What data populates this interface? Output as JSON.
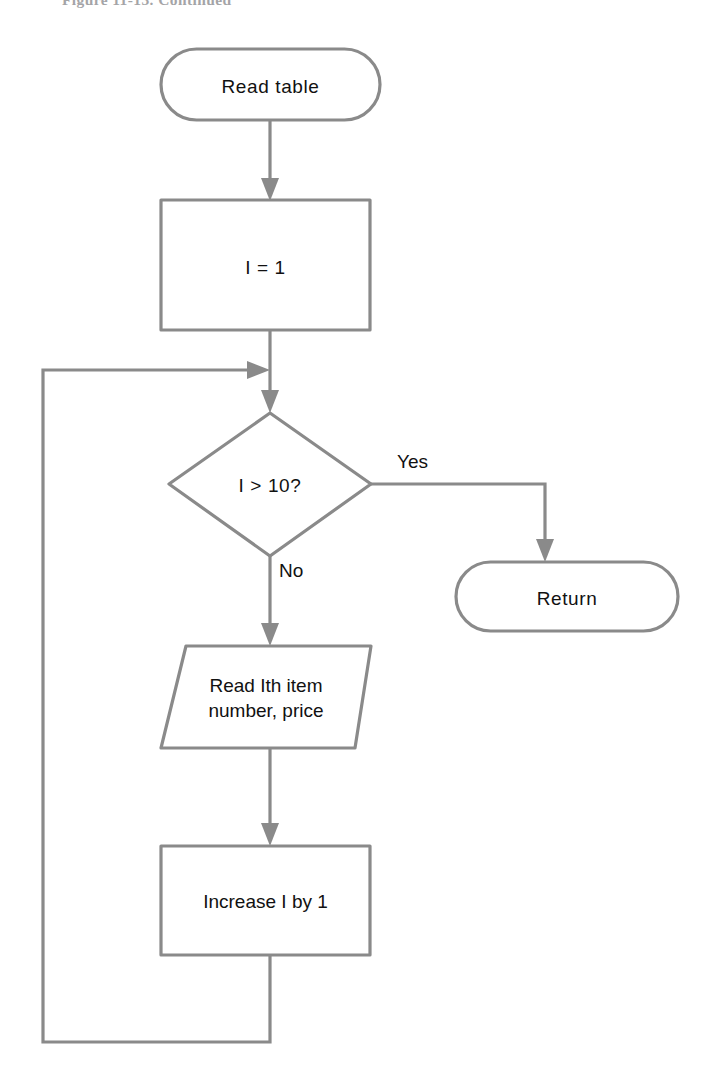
{
  "figure": {
    "caption": "Figure 11-13.  Continued",
    "stroke_color": "#8a8a8a",
    "text_color": "#111111",
    "background_color": "#ffffff"
  },
  "flowchart": {
    "type": "flowchart",
    "orientation": "top-to-bottom",
    "nodes": [
      {
        "id": "start",
        "shape": "terminator",
        "label": "Read table",
        "x": 270,
        "y": 84
      },
      {
        "id": "init",
        "shape": "process",
        "label": "I = 1",
        "x": 265,
        "y": 265
      },
      {
        "id": "test",
        "shape": "decision",
        "label": "I > 10?",
        "x": 270,
        "y": 484
      },
      {
        "id": "return",
        "shape": "terminator",
        "label": "Return",
        "x": 567,
        "y": 596
      },
      {
        "id": "read-item",
        "shape": "input-output",
        "label": "Read Ith item\nnumber, price",
        "x": 270,
        "y": 697
      },
      {
        "id": "increment",
        "shape": "process",
        "label": "Increase I by 1",
        "x": 265,
        "y": 900
      }
    ],
    "edges": [
      {
        "id": "start-to-init",
        "from": "start",
        "to": "init",
        "label": ""
      },
      {
        "id": "init-to-test",
        "from": "init",
        "to": "test",
        "label": ""
      },
      {
        "id": "test-to-return",
        "from": "test",
        "to": "return",
        "label": "Yes"
      },
      {
        "id": "test-to-read",
        "from": "test",
        "to": "read-item",
        "label": "No"
      },
      {
        "id": "read-to-increment",
        "from": "read-item",
        "to": "increment",
        "label": ""
      },
      {
        "id": "increment-to-test",
        "from": "increment",
        "to": "test",
        "label": ""
      }
    ],
    "edge_labels": {
      "yes": "Yes",
      "no": "No"
    }
  }
}
